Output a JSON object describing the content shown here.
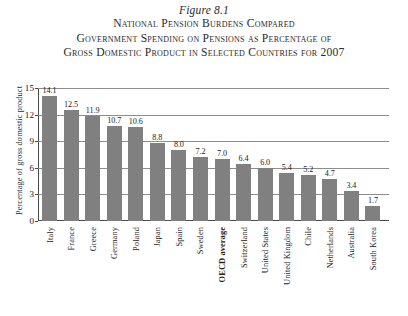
{
  "title": {
    "figure_number": "Figure 8.1",
    "lines": [
      "National Pension Burdens Compared",
      "Government Spending on Pensions as Percentage of",
      "Gross Domestic Product in Selected Countries for 2007"
    ]
  },
  "colors": {
    "bar": "#808080",
    "axis": "#4a4a4a",
    "gridline": "#8d8d8d",
    "text": "#222222"
  },
  "chart_data": {
    "type": "bar",
    "xlabel": "",
    "ylabel": "Percentage of gross domestic product",
    "ylim": [
      0,
      15
    ],
    "yticks": [
      0,
      3,
      6,
      9,
      12,
      15
    ],
    "ytick_labels": [
      "0",
      "3",
      "6",
      "9",
      "12",
      "15"
    ],
    "grid": true,
    "legend": false,
    "categories": [
      "Italy",
      "France",
      "Greece",
      "Germany",
      "Poland",
      "Japan",
      "Spain",
      "Sweden",
      "OECD average",
      "Switzerland",
      "United States",
      "United Kingdom",
      "Chile",
      "Netherlands",
      "Australia",
      "South Korea"
    ],
    "emphasized_categories": [
      "OECD average"
    ],
    "values": [
      14.1,
      12.5,
      11.9,
      10.7,
      10.6,
      8.8,
      8.0,
      7.2,
      7.0,
      6.4,
      6.0,
      5.4,
      5.2,
      4.7,
      3.4,
      1.7
    ],
    "value_labels": [
      "14.1",
      "12.5",
      "11.9",
      "10.7",
      "10.6",
      "8.8",
      "8.0",
      "7.2",
      "7.0",
      "6.4",
      "6.0",
      "5.4",
      "5.2",
      "4.7",
      "3.4",
      "1.7"
    ]
  }
}
